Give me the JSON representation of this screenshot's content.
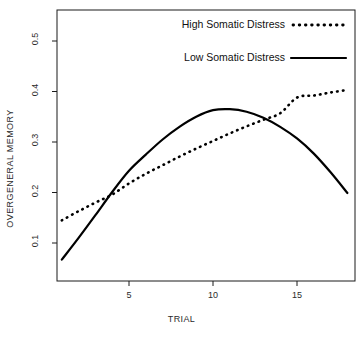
{
  "chart_data": {
    "type": "line",
    "title": "",
    "xlabel": "TRIAL",
    "ylabel": "OVERGENERAL MEMORY",
    "xlim": [
      1,
      18
    ],
    "ylim": [
      0.05,
      0.55
    ],
    "xticks": [
      5,
      10,
      15
    ],
    "xtick_labels": [
      "5",
      "10",
      "15"
    ],
    "yticks": [
      0.1,
      0.2,
      0.3,
      0.4,
      0.5
    ],
    "ytick_labels": [
      "0.1",
      "0.2",
      "0.3",
      "0.4",
      "0.5"
    ],
    "grid": false,
    "legend_position": "top-right",
    "x": [
      1,
      2,
      3,
      4,
      5,
      6,
      7,
      8,
      9,
      10,
      11,
      12,
      13,
      14,
      15,
      16,
      17,
      18
    ],
    "series": [
      {
        "name": "High Somatic Distress",
        "style": "dotted",
        "color": "#000000",
        "values": [
          0.145,
          0.163,
          0.18,
          0.196,
          0.218,
          0.237,
          0.254,
          0.271,
          0.287,
          0.302,
          0.317,
          0.331,
          0.344,
          0.357,
          0.388,
          0.392,
          0.398,
          0.403
        ]
      },
      {
        "name": "Low Somatic Distress",
        "style": "solid",
        "color": "#000000",
        "values": [
          0.067,
          0.11,
          0.155,
          0.201,
          0.243,
          0.275,
          0.305,
          0.33,
          0.35,
          0.363,
          0.365,
          0.36,
          0.348,
          0.33,
          0.307,
          0.277,
          0.24,
          0.199
        ]
      }
    ],
    "annotations": []
  },
  "legend": {
    "entries": [
      {
        "label": "High Somatic Distress",
        "style": "dotted"
      },
      {
        "label": "Low Somatic Distress",
        "style": "solid"
      }
    ]
  }
}
